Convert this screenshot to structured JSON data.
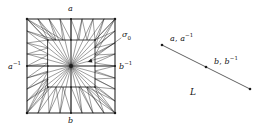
{
  "figure": {
    "kind": "mathematical-diagram",
    "stroke_color": "#1c1c1c",
    "background": "#ffffff"
  },
  "left_diagram": {
    "name": "triangulated-square",
    "outer_square": {
      "x1": 27,
      "y1": 19,
      "x2": 115,
      "y2": 113
    },
    "inner_square": {
      "x1": 48,
      "y1": 40,
      "x2": 95,
      "y2": 87
    },
    "center": {
      "x": 71,
      "y": 66
    },
    "edge_labels": {
      "top": "a",
      "bottom": "b",
      "left_base": "a",
      "left_exp": "-1",
      "right_base": "b",
      "right_exp": "-1"
    },
    "cell_label": {
      "base": "σ",
      "sub": "0"
    },
    "pointer": {
      "from_x": 122,
      "from_y": 37,
      "to_x": 88,
      "to_y": 62
    }
  },
  "right_diagram": {
    "name": "target-segment",
    "segment": {
      "x1": 162,
      "y1": 45,
      "x2": 250,
      "y2": 89
    },
    "label": "L",
    "points": [
      {
        "name": "point-a",
        "x": 162,
        "y": 45,
        "label_parts": [
          {
            "base": "a",
            "exp": ""
          },
          {
            "sep": ", "
          },
          {
            "base": "a",
            "exp": "-1"
          }
        ],
        "label_text": "a, a⁻¹"
      },
      {
        "name": "point-b",
        "x": 206,
        "y": 67,
        "label_parts": [
          {
            "base": "b",
            "exp": ""
          },
          {
            "sep": ", "
          },
          {
            "base": "b",
            "exp": "-1"
          }
        ],
        "label_text": "b, b⁻¹"
      },
      {
        "name": "point-end",
        "x": 250,
        "y": 89,
        "label_text": ""
      }
    ]
  },
  "labels": {
    "top_edge": "a",
    "bottom_edge": "b",
    "left_edge_base": "a",
    "left_edge_exp": "−1",
    "right_edge_base": "b",
    "right_edge_exp": "−1",
    "sigma_base": "σ",
    "sigma_sub": "0",
    "seg_a_base": "a",
    "seg_a_sep": ",",
    "seg_a2_base": "a",
    "seg_a2_exp": "−1",
    "seg_b_base": "b",
    "seg_b_sep": ",",
    "seg_b2_base": "b",
    "seg_b2_exp": "−1",
    "segment_name": "L"
  }
}
